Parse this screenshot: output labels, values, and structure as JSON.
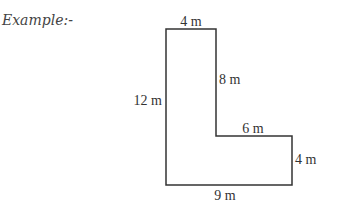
{
  "caption": "Example:-",
  "shape": {
    "type": "L-shape",
    "stroke_color": "#333333",
    "labels": {
      "top": "4 m",
      "inner_vertical": "8 m",
      "left": "12 m",
      "inner_horizontal": "6 m",
      "right": "4 m",
      "bottom": "9 m"
    }
  }
}
